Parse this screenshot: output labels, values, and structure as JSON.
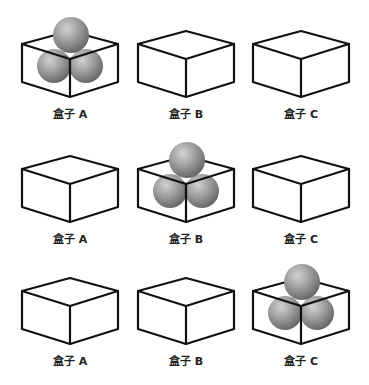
{
  "figure": {
    "ball_color": "#9a9a9a",
    "edge_color": "#111111",
    "rows": [
      {
        "boxes": [
          {
            "label": "盒子 A",
            "has_balls": true,
            "ball_count": 3
          },
          {
            "label": "盒子 B",
            "has_balls": false,
            "ball_count": 0
          },
          {
            "label": "盒子 C",
            "has_balls": false,
            "ball_count": 0
          }
        ]
      },
      {
        "boxes": [
          {
            "label": "盒子 A",
            "has_balls": false,
            "ball_count": 0
          },
          {
            "label": "盒子 B",
            "has_balls": true,
            "ball_count": 3
          },
          {
            "label": "盒子 C",
            "has_balls": false,
            "ball_count": 0
          }
        ]
      },
      {
        "boxes": [
          {
            "label": "盒子 A",
            "has_balls": false,
            "ball_count": 0
          },
          {
            "label": "盒子 B",
            "has_balls": false,
            "ball_count": 0
          },
          {
            "label": "盒子 C",
            "has_balls": true,
            "ball_count": 3
          }
        ]
      }
    ]
  }
}
